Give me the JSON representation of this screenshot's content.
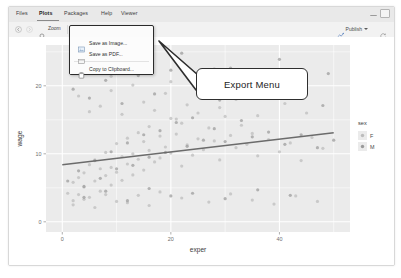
{
  "window": {
    "tabs": [
      {
        "key": "files",
        "label": "Files",
        "active": false
      },
      {
        "key": "plots",
        "label": "Plots",
        "active": true
      },
      {
        "key": "packages",
        "label": "Packages",
        "active": false
      },
      {
        "key": "help",
        "label": "Help",
        "active": false
      },
      {
        "key": "viewer",
        "label": "Viewer",
        "active": false
      }
    ],
    "controls": {
      "minimize": "minimize-icon",
      "maximize": "maximize-icon"
    }
  },
  "toolbar": {
    "back_icon": "back-arrow-icon",
    "forward_icon": "forward-arrow-icon",
    "zoom_label": "Zoom",
    "zoom_icon": "magnifier-icon",
    "export_label": "Export",
    "export_caret": "chevron-down-icon",
    "settings_icon": "gear-icon",
    "clear_icon": "broom-icon",
    "publish_label": "Publish",
    "publish_icon": "publish-icon",
    "publish_caret": "chevron-down-icon",
    "refresh_icon": "refresh-icon"
  },
  "export_menu": {
    "items": [
      {
        "key": "save-image",
        "label": "Save as Image...",
        "icon": "image-icon"
      },
      {
        "key": "save-pdf",
        "label": "Save as PDF...",
        "icon": "pdf-icon"
      },
      {
        "key": "copy-clipboard",
        "label": "Copy to Clipboard...",
        "icon": "clipboard-icon"
      }
    ]
  },
  "annotation": {
    "label": "Export Menu",
    "pointer": "callout-arrow"
  },
  "chart_data": {
    "type": "scatter",
    "title": "",
    "xlabel": "exper",
    "ylabel": "wage",
    "xlim": [
      -3,
      53
    ],
    "ylim": [
      -1.5,
      26
    ],
    "xticks": [
      0,
      20,
      40
    ],
    "yticks": [
      0,
      10,
      20
    ],
    "grid": true,
    "panel_color": "#ebebeb",
    "grid_color": "#ffffff",
    "legend": {
      "title": "sex",
      "position": "right",
      "entries": [
        {
          "label": "F",
          "color": "#bcbcbc"
        },
        {
          "label": "M",
          "color": "#9a9a9a"
        }
      ]
    },
    "trendline": {
      "type": "linear",
      "color": "#6b6b6b",
      "x": [
        0,
        50
      ],
      "y": [
        8.4,
        13.1
      ]
    },
    "point_color": "#a8a8a8",
    "point_opacity": 0.75,
    "point_radius": 1.6,
    "series": [
      {
        "name": "F",
        "color": "#bdbdbd",
        "x": [
          1,
          2,
          2,
          3,
          3,
          4,
          4,
          5,
          5,
          6,
          6,
          7,
          7,
          8,
          8,
          9,
          9,
          10,
          10,
          11,
          11,
          12,
          12,
          13,
          13,
          14,
          14,
          15,
          15,
          16,
          16,
          17,
          18,
          18,
          19,
          20,
          20,
          21,
          22,
          22,
          23,
          24,
          25,
          25,
          26,
          27,
          28,
          29,
          30,
          31,
          32,
          33,
          34,
          35,
          36,
          38,
          40,
          42,
          44,
          46,
          48,
          3,
          5,
          7,
          9,
          11,
          13,
          15,
          17,
          19,
          21,
          23,
          26,
          29,
          32,
          36,
          41,
          45,
          2,
          4,
          6,
          8,
          10,
          12,
          14,
          16,
          18,
          22,
          27,
          31,
          35,
          39,
          43,
          47,
          5,
          9,
          14,
          20,
          28,
          37
        ],
        "y": [
          4.2,
          5.8,
          3.1,
          6.5,
          4.0,
          7.2,
          5.1,
          8.4,
          3.6,
          9.1,
          6.0,
          7.8,
          4.5,
          10.2,
          6.8,
          8.0,
          5.4,
          11.5,
          7.3,
          9.6,
          6.1,
          12.3,
          8.5,
          10.0,
          6.9,
          13.1,
          9.2,
          11.8,
          7.6,
          14.0,
          10.5,
          8.8,
          12.6,
          9.4,
          11.0,
          15.2,
          10.1,
          12.9,
          8.2,
          14.5,
          11.3,
          9.8,
          16.0,
          12.2,
          10.6,
          13.8,
          11.9,
          9.1,
          15.5,
          12.7,
          10.9,
          14.2,
          11.4,
          13.0,
          9.7,
          12.1,
          10.3,
          11.6,
          9.0,
          12.4,
          10.8,
          18.5,
          16.2,
          17.0,
          19.3,
          15.8,
          20.1,
          17.6,
          16.4,
          18.9,
          15.1,
          17.2,
          19.8,
          16.8,
          18.0,
          15.6,
          17.4,
          16.0,
          2.5,
          3.3,
          2.1,
          4.0,
          3.0,
          2.8,
          3.9,
          2.4,
          4.4,
          3.5,
          2.9,
          4.1,
          3.2,
          2.6,
          3.8,
          3.0,
          22.0,
          21.4,
          23.1,
          20.6,
          22.5,
          21.0
        ]
      },
      {
        "name": "M",
        "color": "#9e9e9e",
        "x": [
          1,
          3,
          4,
          6,
          7,
          9,
          10,
          12,
          13,
          15,
          16,
          18,
          19,
          21,
          23,
          24,
          26,
          28,
          30,
          33,
          35,
          38,
          41,
          44,
          47,
          50,
          2,
          5,
          8,
          11,
          14,
          17,
          20,
          25,
          29,
          34,
          39,
          43,
          48,
          4,
          8,
          12,
          16,
          20,
          24,
          30,
          36,
          42,
          6,
          13,
          22,
          31,
          40,
          49
        ],
        "y": [
          6.0,
          7.5,
          5.2,
          9.0,
          6.4,
          10.3,
          7.8,
          11.6,
          8.3,
          12.8,
          9.5,
          13.4,
          10.2,
          14.6,
          11.1,
          15.3,
          12.0,
          13.7,
          11.8,
          14.9,
          12.5,
          13.2,
          11.4,
          12.8,
          10.9,
          12.0,
          19.5,
          18.2,
          20.8,
          17.4,
          21.5,
          18.8,
          22.3,
          19.1,
          17.9,
          20.4,
          18.5,
          19.7,
          17.1,
          3.6,
          4.5,
          3.1,
          4.9,
          3.8,
          4.2,
          3.4,
          4.7,
          3.9,
          24.0,
          23.2,
          24.8,
          22.6,
          23.9,
          21.8
        ]
      }
    ]
  }
}
